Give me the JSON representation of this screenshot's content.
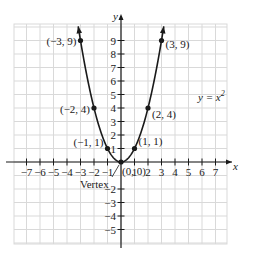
{
  "figure": {
    "equation_label": "y = x",
    "equation_exponent": "2",
    "x_axis_label": "x",
    "y_axis_label": "y",
    "vertex_label": "Vertex",
    "colors": {
      "grid": "#d9d9d9",
      "axis": "#1a1a1a",
      "curve": "#1a1a1a",
      "point": "#1a1a1a"
    }
  },
  "chart_data": {
    "type": "line",
    "xlabel": "x",
    "ylabel": "y",
    "xlim": [
      -8,
      8
    ],
    "ylim": [
      -6,
      10
    ],
    "grid": true,
    "x_ticks": [
      "-7",
      "-6",
      "-5",
      "-4",
      "-3",
      "-2",
      "-1",
      "1",
      "2",
      "3",
      "4",
      "5",
      "6",
      "7"
    ],
    "y_ticks": [
      "9",
      "8",
      "7",
      "6",
      "5",
      "4",
      "3",
      "2",
      "1",
      "-2",
      "-3",
      "-4",
      "-5"
    ],
    "series": [
      {
        "name": "y = x^2",
        "x": [
          -3,
          -2,
          -1,
          0,
          1,
          2,
          3
        ],
        "y": [
          9,
          4,
          1,
          0,
          1,
          4,
          9
        ]
      }
    ],
    "points": [
      {
        "x": -3,
        "y": 9,
        "label": "(−3, 9)"
      },
      {
        "x": -2,
        "y": 4,
        "label": "(−2, 4)"
      },
      {
        "x": -1,
        "y": 1,
        "label": "(−1, 1)"
      },
      {
        "x": 0,
        "y": 0,
        "label": "(0, 0)"
      },
      {
        "x": 1,
        "y": 1,
        "label": "(1, 1)"
      },
      {
        "x": 2,
        "y": 4,
        "label": "(2, 4)"
      },
      {
        "x": 3,
        "y": 9,
        "label": "(3, 9)"
      }
    ],
    "annotations": [
      {
        "text": "Vertex",
        "target": [
          0,
          0
        ]
      },
      {
        "text": "y = x^2",
        "position": [
          5.5,
          3.5
        ]
      }
    ]
  }
}
